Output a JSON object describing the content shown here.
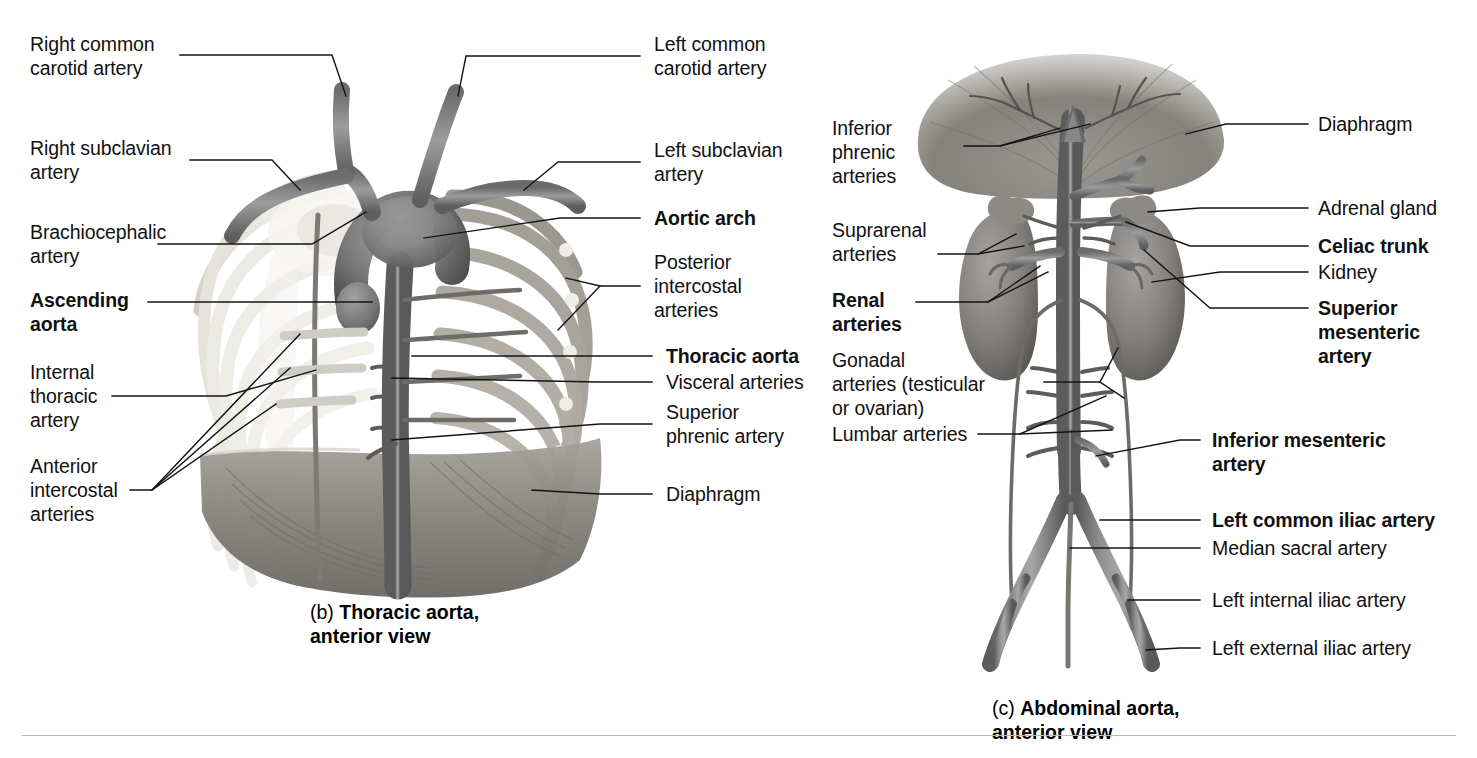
{
  "figure": {
    "background_color": "#ffffff",
    "leader_line_color": "#111111",
    "vessel_color": "#6e6e6e",
    "bone_color": "#e8e6e2",
    "muscle_color": "#8e8b86"
  },
  "panel_b": {
    "caption_letter": "(b) ",
    "caption_text": "Thoracic aorta,\nanterior view",
    "labels_left": [
      {
        "id": "right-common-carotid-artery",
        "text": "Right common\ncarotid artery",
        "bold": false
      },
      {
        "id": "right-subclavian-artery",
        "text": "Right subclavian\nartery",
        "bold": false
      },
      {
        "id": "brachiocephalic-artery",
        "text": "Brachiocephalic\nartery",
        "bold": false
      },
      {
        "id": "ascending-aorta",
        "text": "Ascending\naorta",
        "bold": true
      },
      {
        "id": "internal-thoracic-artery",
        "text": "Internal\nthoracic\nartery",
        "bold": false
      },
      {
        "id": "anterior-intercostal-arteries",
        "text": "Anterior\nintercostal\narteries",
        "bold": false
      }
    ],
    "labels_right": [
      {
        "id": "left-common-carotid-artery",
        "text": "Left common\ncarotid artery",
        "bold": false
      },
      {
        "id": "left-subclavian-artery",
        "text": "Left subclavian\nartery",
        "bold": false
      },
      {
        "id": "aortic-arch",
        "text": "Aortic arch",
        "bold": true
      },
      {
        "id": "posterior-intercostal-arteries",
        "text": "Posterior\nintercostal\narteries",
        "bold": false
      },
      {
        "id": "thoracic-aorta",
        "text": "Thoracic aorta",
        "bold": true
      },
      {
        "id": "visceral-arteries",
        "text": "Visceral arteries",
        "bold": false
      },
      {
        "id": "superior-phrenic-artery",
        "text": "Superior\nphrenic artery",
        "bold": false
      },
      {
        "id": "diaphragm-b",
        "text": "Diaphragm",
        "bold": false
      }
    ]
  },
  "panel_c": {
    "caption_letter": "(c) ",
    "caption_text": "Abdominal aorta,\nanterior view",
    "labels_left": [
      {
        "id": "inferior-phrenic-arteries",
        "text": "Inferior\nphrenic\narteries",
        "bold": false
      },
      {
        "id": "suprarenal-arteries",
        "text": "Suprarenal\narteries",
        "bold": false
      },
      {
        "id": "renal-arteries",
        "text": "Renal\narteries",
        "bold": true
      },
      {
        "id": "gonadal-arteries",
        "text": "Gonadal\narteries (testicular\nor ovarian)",
        "bold": false
      },
      {
        "id": "lumbar-arteries",
        "text": "Lumbar arteries",
        "bold": false
      }
    ],
    "labels_right": [
      {
        "id": "diaphragm-c",
        "text": "Diaphragm",
        "bold": false
      },
      {
        "id": "adrenal-gland",
        "text": "Adrenal gland",
        "bold": false
      },
      {
        "id": "celiac-trunk",
        "text": "Celiac trunk",
        "bold": true
      },
      {
        "id": "kidney",
        "text": "Kidney",
        "bold": false
      },
      {
        "id": "superior-mesenteric-artery",
        "text": "Superior\nmesenteric\nartery",
        "bold": true
      },
      {
        "id": "inferior-mesenteric-artery",
        "text": "Inferior mesenteric\nartery",
        "bold": true
      },
      {
        "id": "left-common-iliac-artery",
        "text": "Left common iliac artery",
        "bold": true
      },
      {
        "id": "median-sacral-artery",
        "text": "Median sacral artery",
        "bold": false
      },
      {
        "id": "left-internal-iliac-artery",
        "text": "Left internal iliac artery",
        "bold": false
      },
      {
        "id": "left-external-iliac-artery",
        "text": "Left external iliac artery",
        "bold": false
      }
    ]
  }
}
